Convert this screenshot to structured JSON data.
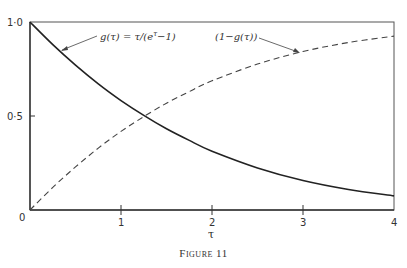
{
  "chart_data": {
    "type": "line",
    "title": "",
    "caption": "Figure 11",
    "xlabel": "τ",
    "ylabel": "",
    "xlim": [
      0,
      4
    ],
    "ylim": [
      0,
      1.0
    ],
    "grid": false,
    "legend": "none (inline annotations with arrows)",
    "x_ticks": [
      {
        "value": 0,
        "label": "0"
      },
      {
        "value": 1,
        "label": "1"
      },
      {
        "value": 2,
        "label": "2"
      },
      {
        "value": 3,
        "label": "3"
      },
      {
        "value": 4,
        "label": "4"
      }
    ],
    "y_ticks": [
      {
        "value": 0,
        "label": "0"
      },
      {
        "value": 0.5,
        "label": "0·5"
      },
      {
        "value": 1.0,
        "label": "1·0"
      }
    ],
    "x": [
      0,
      0.25,
      0.5,
      0.75,
      1.0,
      1.25,
      1.5,
      1.75,
      2.0,
      2.5,
      3.0,
      3.5,
      4.0
    ],
    "series": [
      {
        "name": "g(τ) = τ/(e^τ−1)",
        "style": "solid",
        "values": [
          1.0,
          0.88,
          0.771,
          0.671,
          0.582,
          0.503,
          0.432,
          0.37,
          0.313,
          0.224,
          0.157,
          0.109,
          0.075
        ]
      },
      {
        "name": "(1−g(τ))",
        "style": "dashed",
        "values": [
          0.0,
          0.12,
          0.229,
          0.329,
          0.418,
          0.497,
          0.568,
          0.63,
          0.687,
          0.776,
          0.843,
          0.891,
          0.925
        ]
      }
    ],
    "annotations": [
      {
        "text": "g(τ) = τ/(e^τ−1)",
        "points_to": {
          "x": 0.35,
          "y": 0.84
        }
      },
      {
        "text": "(1−g(τ))",
        "points_to": {
          "x": 2.9,
          "y": 0.83
        }
      }
    ]
  },
  "labels": {
    "ann_g": "g(τ) = τ/(e",
    "ann_g_sup": "τ",
    "ann_g_tail": "−1)",
    "ann_1mg": "(1−g(τ))",
    "xlabel": "τ",
    "caption": "Figure 11",
    "ytick_0": "0",
    "ytick_05": "0·5",
    "ytick_10": "1·0",
    "xtick_1": "1",
    "xtick_2": "2",
    "xtick_3": "3",
    "xtick_4": "4"
  }
}
